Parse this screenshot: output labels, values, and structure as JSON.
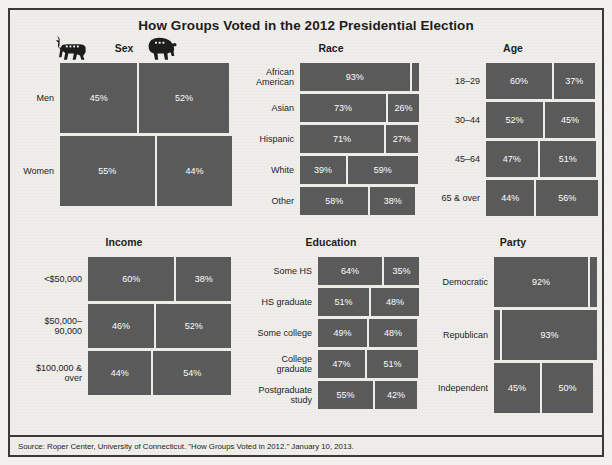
{
  "title": "How Groups Voted in the 2012 Presidential Election",
  "source": "Source: Roper Center, University of Connecticut. \"How Groups Voted in 2012.\" January 10, 2013.",
  "legend": {
    "democrat_icon": "donkey-icon",
    "republican_icon": "elephant-icon"
  },
  "colors": {
    "bar": "#5b5b5b",
    "background": "#efeeeb",
    "border": "#3a3a3a",
    "bar_label": "#ffffff"
  },
  "panels": {
    "sex": {
      "title": "Sex"
    },
    "race": {
      "title": "Race"
    },
    "age": {
      "title": "Age"
    },
    "income": {
      "title": "Income"
    },
    "education": {
      "title": "Education"
    },
    "party": {
      "title": "Party"
    }
  },
  "chart_data": {
    "type": "bar",
    "title": "How Groups Voted in the 2012 Presidential Election",
    "subtitle": "",
    "xlabel": "Share of vote (%)",
    "ylabel": "",
    "xlim": [
      0,
      100
    ],
    "grid": false,
    "legend_position": "top (donkey = Democrat, elephant = Republican)",
    "series": [
      {
        "name": "Democrat",
        "key": "dem"
      },
      {
        "name": "Republican",
        "key": "rep"
      }
    ],
    "panels": [
      {
        "name": "Sex",
        "categories": [
          "Men",
          "Women"
        ],
        "rows": [
          {
            "label": "Men",
            "dem": 45,
            "rep": 52,
            "dem_label": "45%",
            "rep_label": "52%"
          },
          {
            "label": "Women",
            "dem": 55,
            "rep": 44,
            "dem_label": "55%",
            "rep_label": "44%"
          }
        ]
      },
      {
        "name": "Race",
        "categories": [
          "African American",
          "Asian",
          "Hispanic",
          "White",
          "Other"
        ],
        "rows": [
          {
            "label": "African\nAmerican",
            "dem": 93,
            "rep": 6,
            "dem_label": "93%",
            "rep_label": ""
          },
          {
            "label": "Asian",
            "dem": 73,
            "rep": 26,
            "dem_label": "73%",
            "rep_label": "26%"
          },
          {
            "label": "Hispanic",
            "dem": 71,
            "rep": 27,
            "dem_label": "71%",
            "rep_label": "27%"
          },
          {
            "label": "White",
            "dem": 39,
            "rep": 59,
            "dem_label": "39%",
            "rep_label": "59%"
          },
          {
            "label": "Other",
            "dem": 58,
            "rep": 38,
            "dem_label": "58%",
            "rep_label": "38%"
          }
        ]
      },
      {
        "name": "Age",
        "categories": [
          "18–29",
          "30–44",
          "45–64",
          "65 & over"
        ],
        "rows": [
          {
            "label": "18–29",
            "dem": 60,
            "rep": 37,
            "dem_label": "60%",
            "rep_label": "37%"
          },
          {
            "label": "30–44",
            "dem": 52,
            "rep": 45,
            "dem_label": "52%",
            "rep_label": "45%"
          },
          {
            "label": "45–64",
            "dem": 47,
            "rep": 51,
            "dem_label": "47%",
            "rep_label": "51%"
          },
          {
            "label": "65 & over",
            "dem": 44,
            "rep": 56,
            "dem_label": "44%",
            "rep_label": "56%"
          }
        ]
      },
      {
        "name": "Income",
        "categories": [
          "<$50,000",
          "$50,000–90,000",
          "$100,000 & over"
        ],
        "rows": [
          {
            "label": "<$50,000",
            "dem": 60,
            "rep": 38,
            "dem_label": "60%",
            "rep_label": "38%"
          },
          {
            "label": "$50,000–\n90,000",
            "dem": 46,
            "rep": 52,
            "dem_label": "46%",
            "rep_label": "52%"
          },
          {
            "label": "$100,000 &\nover",
            "dem": 44,
            "rep": 54,
            "dem_label": "44%",
            "rep_label": "54%"
          }
        ]
      },
      {
        "name": "Education",
        "categories": [
          "Some HS",
          "HS graduate",
          "Some college",
          "College graduate",
          "Postgraduate study"
        ],
        "rows": [
          {
            "label": "Some HS",
            "dem": 64,
            "rep": 35,
            "dem_label": "64%",
            "rep_label": "35%"
          },
          {
            "label": "HS graduate",
            "dem": 51,
            "rep": 48,
            "dem_label": "51%",
            "rep_label": "48%"
          },
          {
            "label": "Some college",
            "dem": 49,
            "rep": 48,
            "dem_label": "49%",
            "rep_label": "48%"
          },
          {
            "label": "College\ngraduate",
            "dem": 47,
            "rep": 51,
            "dem_label": "47%",
            "rep_label": "51%"
          },
          {
            "label": "Postgraduate\nstudy",
            "dem": 55,
            "rep": 42,
            "dem_label": "55%",
            "rep_label": "42%"
          }
        ]
      },
      {
        "name": "Party",
        "categories": [
          "Democratic",
          "Republican",
          "Independent"
        ],
        "rows": [
          {
            "label": "Democratic",
            "dem": 92,
            "rep": 7,
            "dem_label": "92%",
            "rep_label": ""
          },
          {
            "label": "Republican",
            "dem": 6,
            "rep": 93,
            "dem_label": "",
            "rep_label": "93%"
          },
          {
            "label": "Independent",
            "dem": 45,
            "rep": 50,
            "dem_label": "45%",
            "rep_label": "50%"
          }
        ]
      }
    ]
  }
}
